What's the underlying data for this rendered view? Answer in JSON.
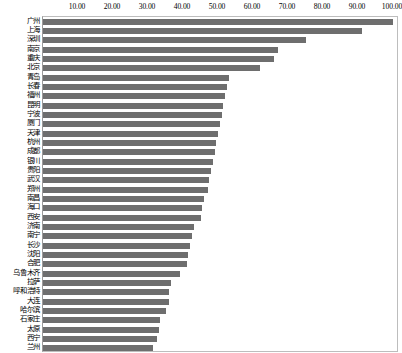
{
  "chart_data": {
    "type": "bar",
    "orientation": "horizontal",
    "title": "",
    "subtitle": "",
    "xlabel": "",
    "ylabel": "",
    "xlim": [
      0,
      100
    ],
    "ylim": null,
    "grid": false,
    "legend": null,
    "legend_position": "none",
    "axis_position": "top",
    "bar_color": "#6e6e6e",
    "plot_border_color": "#bdbdbd",
    "xticks": [
      "10.00",
      "20.00",
      "30.00",
      "40.00",
      "50.00",
      "60.00",
      "70.00",
      "80.00",
      "90.00",
      "100.00"
    ],
    "xtick_values": [
      10,
      20,
      30,
      40,
      50,
      60,
      70,
      80,
      90,
      100
    ],
    "categories": [
      "广州",
      "上海",
      "深圳",
      "南京",
      "重庆",
      "北京",
      "青岛",
      "长春",
      "福州",
      "昆明",
      "宁波",
      "厦门",
      "天津",
      "杭州",
      "成都",
      "银川",
      "贵阳",
      "武汉",
      "郑州",
      "南昌",
      "海口",
      "西安",
      "济南",
      "南宁",
      "长沙",
      "沈阳",
      "合肥",
      "乌鲁木齐",
      "拉萨",
      "呼和浩特",
      "大连",
      "哈尔滨",
      "石家庄",
      "太原",
      "西宁",
      "兰州"
    ],
    "values": [
      100.0,
      91.0,
      75.0,
      67.0,
      66.0,
      62.0,
      53.0,
      52.5,
      52.0,
      51.5,
      51.0,
      50.5,
      50.0,
      49.5,
      49.0,
      48.5,
      48.0,
      47.5,
      47.0,
      46.0,
      45.5,
      45.0,
      43.0,
      42.5,
      42.0,
      41.5,
      41.0,
      39.0,
      36.5,
      36.0,
      36.0,
      35.0,
      33.5,
      33.0,
      32.5,
      31.5
    ],
    "series": [
      {
        "name": "",
        "values": [
          100.0,
          91.0,
          75.0,
          67.0,
          66.0,
          62.0,
          53.0,
          52.5,
          52.0,
          51.5,
          51.0,
          50.5,
          50.0,
          49.5,
          49.0,
          48.5,
          48.0,
          47.5,
          47.0,
          46.0,
          45.5,
          45.0,
          43.0,
          42.5,
          42.0,
          41.5,
          41.0,
          39.0,
          36.5,
          36.0,
          36.0,
          35.0,
          33.5,
          33.0,
          32.5,
          31.5
        ]
      }
    ]
  }
}
